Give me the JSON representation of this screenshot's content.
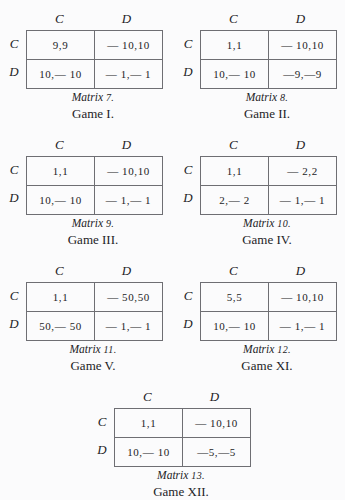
{
  "page": {
    "background_color": "#fbfbfc",
    "ink_color": "#232326",
    "rule_color": "#6e6e73"
  },
  "matrices": [
    {
      "column_headers": [
        "C",
        "D"
      ],
      "row_headers": [
        "C",
        "D"
      ],
      "cells": [
        [
          "9,9",
          "— 10,10"
        ],
        [
          "10,— 10",
          "— 1,— 1"
        ]
      ],
      "caption_label": "Matrix",
      "caption_number": "7.",
      "caption_game": "Game I."
    },
    {
      "column_headers": [
        "C",
        "D"
      ],
      "row_headers": [
        "C",
        "D"
      ],
      "cells": [
        [
          "1,1",
          "— 10,10"
        ],
        [
          "10,— 10",
          "—9,—9"
        ]
      ],
      "caption_label": "Matrix",
      "caption_number": "8.",
      "caption_game": "Game II."
    },
    {
      "column_headers": [
        "C",
        "D"
      ],
      "row_headers": [
        "C",
        "D"
      ],
      "cells": [
        [
          "1,1",
          "— 10,10"
        ],
        [
          "10,— 10",
          "— 1,— 1"
        ]
      ],
      "caption_label": "Matrix",
      "caption_number": "9.",
      "caption_game": "Game III."
    },
    {
      "column_headers": [
        "C",
        "D"
      ],
      "row_headers": [
        "C",
        "D"
      ],
      "cells": [
        [
          "1,1",
          "— 2,2"
        ],
        [
          "2,— 2",
          "— 1,— 1"
        ]
      ],
      "caption_label": "Matrix",
      "caption_number": "10.",
      "caption_game": "Game IV."
    },
    {
      "column_headers": [
        "C",
        "D"
      ],
      "row_headers": [
        "C",
        "D"
      ],
      "cells": [
        [
          "1,1",
          "— 50,50"
        ],
        [
          "50,— 50",
          "— 1,— 1"
        ]
      ],
      "caption_label": "Matrix",
      "caption_number": "11.",
      "caption_game": "Game V."
    },
    {
      "column_headers": [
        "C",
        "D"
      ],
      "row_headers": [
        "C",
        "D"
      ],
      "cells": [
        [
          "5,5",
          "— 10,10"
        ],
        [
          "10,— 10",
          "— 1,— 1"
        ]
      ],
      "caption_label": "Matrix",
      "caption_number": "12.",
      "caption_game": "Game XI."
    },
    {
      "column_headers": [
        "C",
        "D"
      ],
      "row_headers": [
        "C",
        "D"
      ],
      "cells": [
        [
          "1,1",
          "— 10,10"
        ],
        [
          "10,— 10",
          "—5,—5"
        ]
      ],
      "caption_label": "Matrix",
      "caption_number": "13.",
      "caption_game": "Game XII."
    }
  ]
}
